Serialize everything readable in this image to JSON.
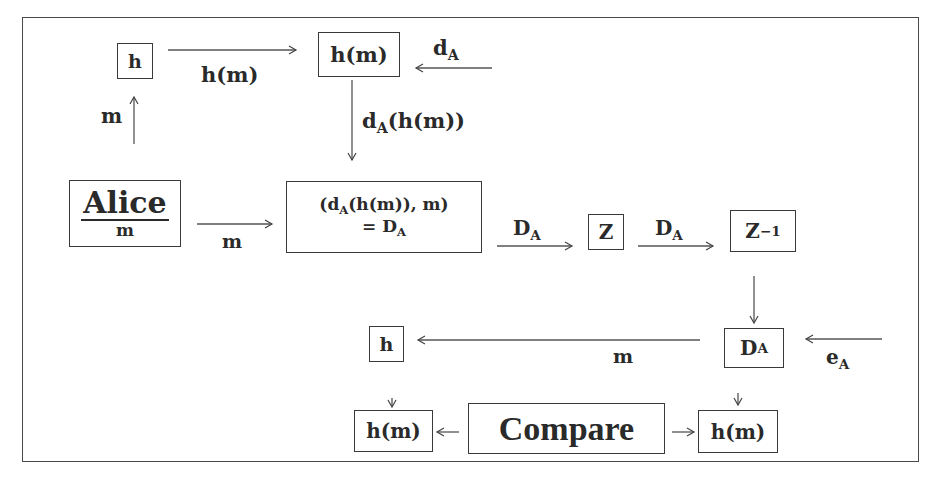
{
  "diagram": {
    "nodes": {
      "hash_top": {
        "label": "h"
      },
      "hash_value_top": {
        "label": "h(m)"
      },
      "alice": {
        "name": "Alice",
        "message": "m"
      },
      "signed_pair": {
        "line1_prefix": "(d",
        "line1_sub": "A",
        "line1_suffix": "(h(m)), m)",
        "line2_prefix": "= D",
        "line2_sub": "A"
      },
      "z": {
        "label": "Z"
      },
      "z_inverse": {
        "label": "Z",
        "sup": "−1"
      },
      "da_bottom": {
        "label": "D",
        "sub": "A"
      },
      "hash_bottom": {
        "label": "h"
      },
      "hash_value_left": {
        "label": "h(m)"
      },
      "compare": {
        "label": "Compare"
      },
      "hash_value_right": {
        "label": "h(m)"
      }
    },
    "edges": {
      "h_to_hm": {
        "label": "h(m)"
      },
      "m_up": {
        "label": "m"
      },
      "da_into_hm": {
        "label": "d",
        "sub": "A"
      },
      "hm_down": {
        "prefix": "d",
        "sub": "A",
        "suffix": "(h(m))"
      },
      "alice_to_pair": {
        "label": "m"
      },
      "pair_to_z": {
        "label": "D",
        "sub": "A"
      },
      "z_to_zinv": {
        "label": "D",
        "sub": "A"
      },
      "da_to_h": {
        "label": "m"
      },
      "ea_into_da": {
        "label": "e",
        "sub": "A"
      }
    }
  }
}
